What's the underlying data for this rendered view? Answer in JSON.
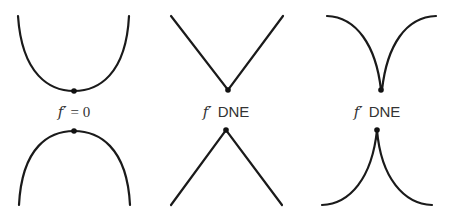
{
  "figure": {
    "title": "",
    "stroke_color": "#1a1a1a",
    "point_color": "#111111",
    "columns": [
      {
        "id": "smooth",
        "label_func": "f′",
        "label_rest": "= 0",
        "top_shape": "parabola-opening-up (local minimum, smooth)",
        "bottom_shape": "parabola-opening-down (local maximum, smooth)"
      },
      {
        "id": "corner",
        "label_func": "f′",
        "label_rest": "DNE",
        "top_shape": "V corner (local minimum)",
        "bottom_shape": "inverted V corner (local maximum)"
      },
      {
        "id": "cusp",
        "label_func": "f′",
        "label_rest": "DNE",
        "top_shape": "cusp pointing down (local minimum)",
        "bottom_shape": "cusp pointing up (local maximum)"
      }
    ]
  }
}
